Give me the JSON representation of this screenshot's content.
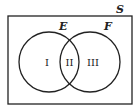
{
  "diagram": {
    "type": "venn",
    "universe_label": "S",
    "sets": [
      {
        "label": "E",
        "cx": 49,
        "cy": 62,
        "r": 30
      },
      {
        "label": "F",
        "cx": 90,
        "cy": 62,
        "r": 30
      }
    ],
    "regions": [
      {
        "label": "I",
        "description": "E only"
      },
      {
        "label": "II",
        "description": "E and F"
      },
      {
        "label": "III",
        "description": "F only"
      }
    ],
    "colors": {
      "stroke": "#222222",
      "background": "#ffffff"
    }
  }
}
